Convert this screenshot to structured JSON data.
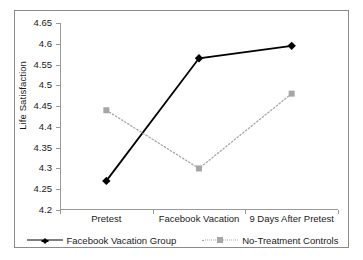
{
  "chart_data": {
    "type": "line",
    "title": "",
    "xlabel": "",
    "ylabel": "Life Satisfaction",
    "categories": [
      "Pretest",
      "Facebook Vacation",
      "9 Days After Pretest"
    ],
    "ylim": [
      4.2,
      4.65
    ],
    "ytick_step": 0.05,
    "yticks": [
      "4.65",
      "4.6",
      "4.55",
      "4.5",
      "4.45",
      "4.4",
      "4.35",
      "4.3",
      "4.25",
      "4.2"
    ],
    "ytick_values": [
      4.65,
      4.6,
      4.55,
      4.5,
      4.45,
      4.4,
      4.35,
      4.3,
      4.25,
      4.2
    ],
    "grid": false,
    "legend_position": "bottom",
    "series": [
      {
        "name": "Facebook Vacation Group",
        "values": [
          4.27,
          4.565,
          4.595
        ],
        "color": "#000000",
        "marker": "diamond",
        "linestyle": "solid"
      },
      {
        "name": "No-Treatment Controls",
        "values": [
          4.44,
          4.3,
          4.48
        ],
        "color": "#a6a6a6",
        "marker": "square",
        "linestyle": "dotted"
      }
    ]
  },
  "figure": {
    "border_color": "#8a8a8a",
    "background": "#ffffff",
    "axis_color": "#9a9a9a"
  }
}
